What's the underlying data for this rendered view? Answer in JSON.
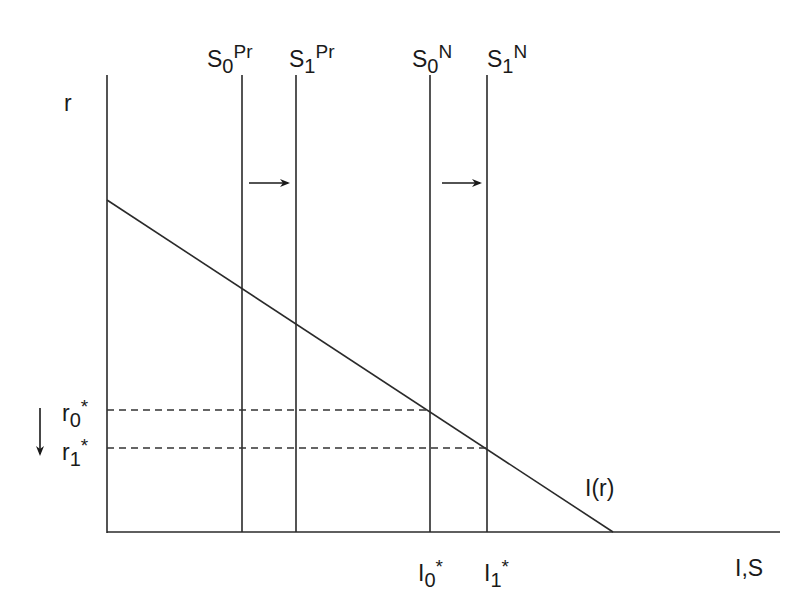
{
  "diagram": {
    "axes": {
      "y_label": "r",
      "x_label": "I,S"
    },
    "curves": {
      "investment_demand": {
        "label": "I(r)"
      },
      "supply_private": [
        {
          "base": "S",
          "sub": "0",
          "sup": "Pr"
        },
        {
          "base": "S",
          "sub": "1",
          "sup": "Pr"
        }
      ],
      "supply_national": [
        {
          "base": "S",
          "sub": "0",
          "sup": "N"
        },
        {
          "base": "S",
          "sub": "1",
          "sup": "N"
        }
      ]
    },
    "equilibrium": {
      "rates": [
        {
          "base": "r",
          "sub": "0",
          "star": "*"
        },
        {
          "base": "r",
          "sub": "1",
          "star": "*"
        }
      ],
      "investment": [
        {
          "base": "I",
          "sub": "0",
          "star": "*"
        },
        {
          "base": "I",
          "sub": "1",
          "star": "*"
        }
      ]
    },
    "arrows": {
      "private_shift": "right",
      "national_shift": "right",
      "rate_change": "down"
    },
    "colors": {
      "line": "#2a2a2a",
      "dashed": "#333333",
      "background": "#ffffff"
    }
  }
}
